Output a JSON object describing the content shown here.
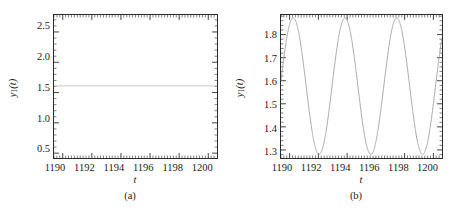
{
  "figure": {
    "background_color": "#ffffff",
    "frame_color": "#2b2b2b",
    "panels": [
      {
        "id": "a",
        "caption": "(a)",
        "xlabel": "t",
        "ylabel_base": "y",
        "ylabel_sub": "1",
        "ylabel_arg": "(t)",
        "curve_color": "#c9c9c9",
        "yticks": [
          "0.5",
          "1.0",
          "1.5",
          "2.0",
          "2.5"
        ],
        "ytick_values": [
          0.5,
          1.0,
          1.5,
          2.0,
          2.5
        ],
        "xticks": [
          "1190",
          "1192",
          "1194",
          "1196",
          "1198",
          "1200"
        ],
        "xtick_values": [
          1190,
          1192,
          1194,
          1196,
          1198,
          1200
        ]
      },
      {
        "id": "b",
        "caption": "(b)",
        "xlabel": "t",
        "ylabel_base": "y",
        "ylabel_sub": "1",
        "ylabel_arg": "(t)",
        "curve_color": "#a8a8a8",
        "yticks": [
          "1.3",
          "1.4",
          "1.5",
          "1.6",
          "1.7",
          "1.8"
        ],
        "ytick_values": [
          1.3,
          1.4,
          1.5,
          1.6,
          1.7,
          1.8
        ],
        "xticks": [
          "1190",
          "1192",
          "1194",
          "1196",
          "1198",
          "1200"
        ],
        "xtick_values": [
          1190,
          1192,
          1194,
          1996,
          1198,
          1200
        ]
      }
    ]
  },
  "chart_data": [
    {
      "type": "line",
      "panel": "(a)",
      "title": "",
      "xlabel": "t",
      "ylabel": "y1(t)",
      "xlim": [
        1189.4,
        1200.6
      ],
      "ylim": [
        0.42,
        2.78
      ],
      "grid": false,
      "legend": "none",
      "series": [
        {
          "name": "y1(t)",
          "description": "steady state fixed point, constant value",
          "constant_value": 1.61,
          "x": [
            1190,
            1191,
            1192,
            1193,
            1194,
            1195,
            1196,
            1197,
            1198,
            1199,
            1200
          ],
          "values": [
            1.61,
            1.61,
            1.61,
            1.61,
            1.61,
            1.61,
            1.61,
            1.61,
            1.61,
            1.61,
            1.61
          ]
        }
      ]
    },
    {
      "type": "line",
      "panel": "(b)",
      "title": "",
      "xlabel": "t",
      "ylabel": "y1(t)",
      "xlim": [
        1189.4,
        1200.6
      ],
      "ylim": [
        1.265,
        1.885
      ],
      "grid": false,
      "legend": "none",
      "series": [
        {
          "name": "y1(t)",
          "description": "periodic oscillation (limit cycle)",
          "period": 3.6,
          "peak_value": 1.872,
          "trough_value": 1.281,
          "peak_times": [
            1190.25,
            1193.85,
            1197.45
          ],
          "trough_times": [
            1192.0,
            1195.6,
            1199.2
          ],
          "x": [
            1189.4,
            1189.7,
            1190.0,
            1190.25,
            1190.5,
            1190.8,
            1191.1,
            1191.4,
            1191.7,
            1192.0,
            1192.3,
            1192.6,
            1192.9,
            1193.2,
            1193.5,
            1193.85,
            1194.2,
            1194.5,
            1194.8,
            1195.1,
            1195.4,
            1195.6,
            1195.9,
            1196.2,
            1196.5,
            1196.8,
            1197.1,
            1197.45,
            1197.8,
            1198.1,
            1198.4,
            1198.7,
            1199.0,
            1199.2,
            1199.5,
            1199.8,
            1200.0,
            1200.6
          ],
          "values": [
            1.8,
            1.855,
            1.872,
            1.872,
            1.855,
            1.79,
            1.68,
            1.545,
            1.4,
            1.285,
            1.29,
            1.36,
            1.47,
            1.6,
            1.74,
            1.872,
            1.86,
            1.79,
            1.68,
            1.545,
            1.4,
            1.285,
            1.3,
            1.37,
            1.48,
            1.61,
            1.75,
            1.872,
            1.855,
            1.78,
            1.66,
            1.5,
            1.35,
            1.285,
            1.34,
            1.46,
            1.55,
            1.78
          ]
        }
      ]
    }
  ]
}
